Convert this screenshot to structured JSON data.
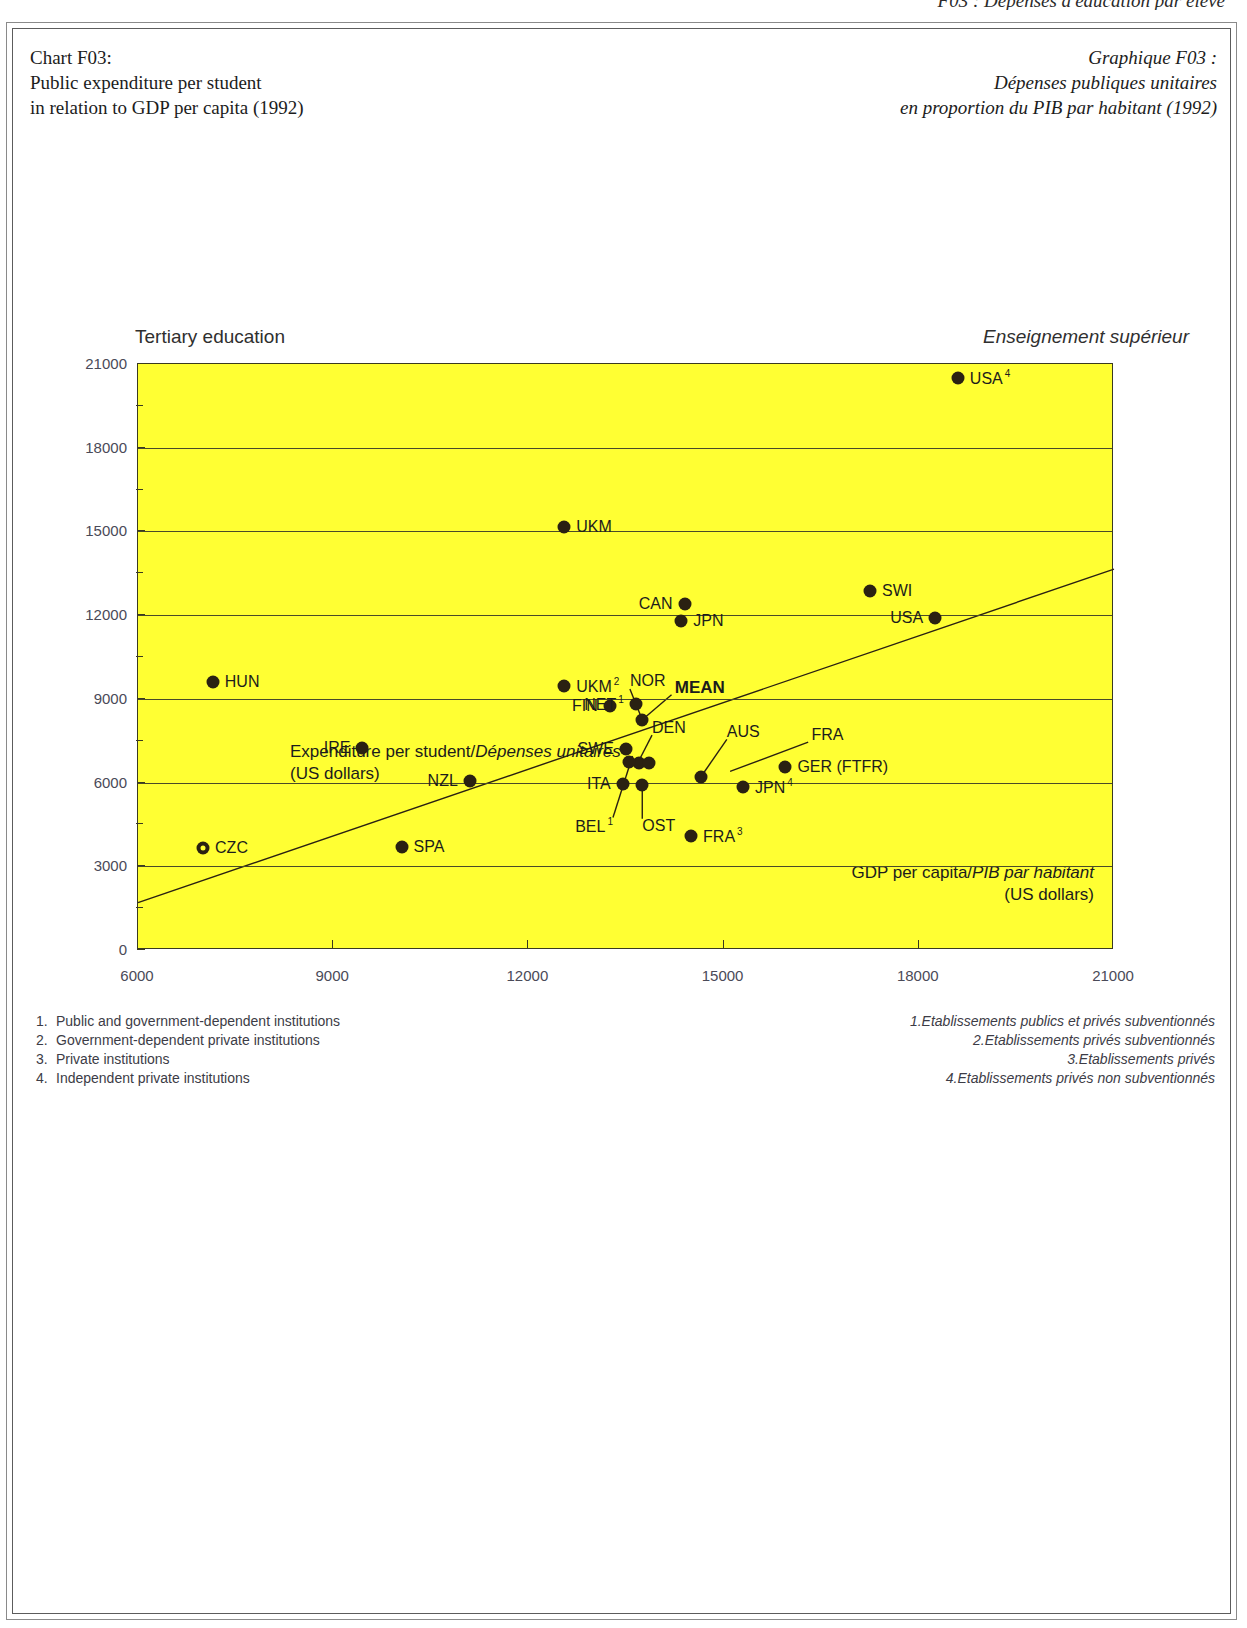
{
  "running_head": "F03 : Dépenses d'éducation par élève",
  "title_left": [
    "Chart F03:",
    "Public expenditure per student",
    "in relation to GDP per capita (1992)"
  ],
  "title_right": [
    "Graphique F03 :",
    "Dépenses publiques unitaires",
    "en proportion du PIB par habitant (1992)"
  ],
  "section_head_left": "Tertiary education",
  "section_head_right": "Enseignement supérieur",
  "colors": {
    "plot_background": "#ffff33",
    "marker": "#2a2112",
    "axis": "#3a3a20",
    "tick_text": "#4a4a58"
  },
  "y_axis_caption": {
    "line1_en": "Expenditure per student/",
    "line1_fr": "Dépenses unitaires",
    "line2": "(US dollars)"
  },
  "x_axis_caption": {
    "line1_en": "GDP per capita/",
    "line1_fr": "PIB par habitant",
    "line2": "(US dollars)"
  },
  "footnotes_en": [
    {
      "num": "1.",
      "text": "Public and government-dependent institutions"
    },
    {
      "num": "2.",
      "text": "Government-dependent private institutions"
    },
    {
      "num": "3.",
      "text": "Private institutions"
    },
    {
      "num": "4.",
      "text": "Independent private institutions"
    }
  ],
  "footnotes_fr": [
    {
      "num": "1.",
      "text": "Etablissements publics et privés subventionnés"
    },
    {
      "num": "2.",
      "text": "Etablissements privés subventionnés"
    },
    {
      "num": "3.",
      "text": "Etablissements privés"
    },
    {
      "num": "4.",
      "text": "Etablissements privés non subventionnés"
    }
  ],
  "chart_data": {
    "type": "scatter",
    "xlabel": "GDP per capita (US dollars)",
    "ylabel": "Expenditure per student (US dollars)",
    "xlim": [
      6000,
      21000
    ],
    "ylim": [
      0,
      21000
    ],
    "xticks": [
      6000,
      9000,
      12000,
      15000,
      18000,
      21000
    ],
    "yticks": [
      0,
      3000,
      6000,
      9000,
      12000,
      15000,
      18000,
      21000
    ],
    "y_minor_step": 1500,
    "grid": "horizontal",
    "legend": "none",
    "trendline": {
      "label": "regression",
      "x0": 6000,
      "y0": 1700,
      "x1": 21000,
      "y1": 13650
    },
    "points": [
      {
        "code": "USA",
        "note": "4",
        "x": 18600,
        "y": 20500,
        "label_side": "right"
      },
      {
        "code": "UKM",
        "note": "",
        "x": 12550,
        "y": 15150,
        "label_side": "right"
      },
      {
        "code": "SWI",
        "note": "",
        "x": 17250,
        "y": 12850,
        "label_side": "right"
      },
      {
        "code": "CAN",
        "note": "",
        "x": 14400,
        "y": 12400,
        "label_side": "left"
      },
      {
        "code": "JPN",
        "note": "",
        "x": 14350,
        "y": 11800,
        "label_side": "right"
      },
      {
        "code": "USA",
        "note": "",
        "x": 18250,
        "y": 11900,
        "label_side": "left"
      },
      {
        "code": "HUN",
        "note": "",
        "x": 7150,
        "y": 9600,
        "label_side": "right"
      },
      {
        "code": "UKM",
        "note": "2",
        "x": 12550,
        "y": 9450,
        "label_side": "right"
      },
      {
        "code": "FIN",
        "note": "",
        "x": 13250,
        "y": 8750,
        "label_side": "left"
      },
      {
        "code": "NET",
        "note": "1",
        "x": 13650,
        "y": 8800,
        "label_side": "left"
      },
      {
        "code": "NOR",
        "note": "",
        "x": 13750,
        "y": 8250,
        "label_side": "callout"
      },
      {
        "code": "MEAN",
        "note": "",
        "x": 13750,
        "y": 8250,
        "label_side": "callout"
      },
      {
        "code": "IRE",
        "note": "",
        "x": 9450,
        "y": 7250,
        "label_side": "left"
      },
      {
        "code": "SWE",
        "note": "",
        "x": 13500,
        "y": 7200,
        "label_side": "left"
      },
      {
        "code": "DEN",
        "note": "",
        "x": 13700,
        "y": 6700,
        "label_side": "callout"
      },
      {
        "code": "AUS",
        "note": "",
        "x": 13850,
        "y": 6700,
        "label_side": "callout"
      },
      {
        "code": "NZL",
        "note": "",
        "x": 11100,
        "y": 6050,
        "label_side": "left"
      },
      {
        "code": "GER (FTFR)",
        "note": "",
        "x": 15950,
        "y": 6550,
        "label_side": "right"
      },
      {
        "code": "FRA",
        "note": "",
        "x": 14650,
        "y": 6200,
        "label_side": "callout"
      },
      {
        "code": "ITA",
        "note": "",
        "x": 13450,
        "y": 5950,
        "label_side": "left"
      },
      {
        "code": "OST",
        "note": "",
        "x": 13750,
        "y": 5900,
        "label_side": "callout"
      },
      {
        "code": "JPN",
        "note": "4",
        "x": 15300,
        "y": 5850,
        "label_side": "right"
      },
      {
        "code": "BEL",
        "note": "1",
        "x": 13550,
        "y": 6750,
        "label_side": "callout"
      },
      {
        "code": "FRA",
        "note": "3",
        "x": 14500,
        "y": 4100,
        "label_side": "right"
      },
      {
        "code": "SPA",
        "note": "",
        "x": 10050,
        "y": 3700,
        "label_side": "right"
      },
      {
        "code": "CZC",
        "note": "",
        "x": 7000,
        "y": 3650,
        "label_side": "right",
        "marker": "hollow"
      }
    ]
  }
}
